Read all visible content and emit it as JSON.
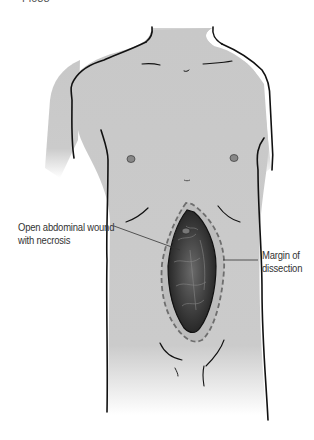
{
  "figure": {
    "title_fragment": "Fi038",
    "labels": {
      "wound": [
        "Open abdominal wound",
        "with necrosis"
      ],
      "margin": [
        "Margin of",
        "dissection"
      ]
    },
    "colors": {
      "skin": "#c9c9c9",
      "outline": "#111111",
      "wound": "#3a3a3a",
      "dashed_margin": "#7a7a7a",
      "background": "#ffffff"
    }
  }
}
